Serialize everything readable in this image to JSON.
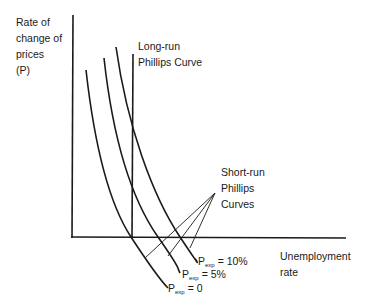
{
  "diagram": {
    "y_axis_label": [
      "Rate of",
      "change of",
      "prices",
      "(P)"
    ],
    "x_axis_label": [
      "Unemployment",
      "rate"
    ],
    "long_run_label": [
      "Long-run",
      "Phillips Curve"
    ],
    "short_run_label": [
      "Short-run",
      "Phillips",
      "Curves"
    ],
    "curves": [
      {
        "symbol": "P",
        "subscript": "exp",
        "value": "= 0"
      },
      {
        "symbol": "P",
        "subscript": "exp",
        "value": "= 5%"
      },
      {
        "symbol": "P",
        "subscript": "exp",
        "value": "= 10%"
      }
    ],
    "line_color": "#1a1a1a"
  }
}
